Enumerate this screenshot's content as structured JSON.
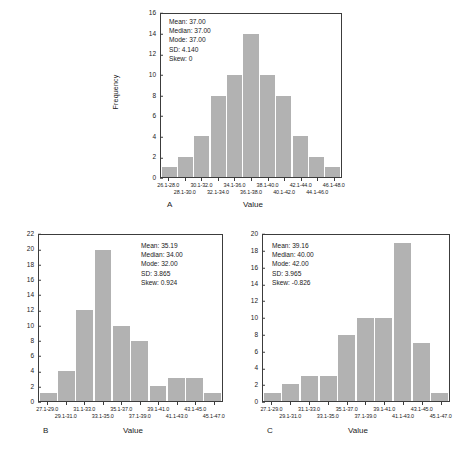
{
  "figure": {
    "background": "#ffffff",
    "bar_color": "#b2b2b2",
    "axis_color": "#3c3c3c"
  },
  "chart_data": [
    {
      "type": "bar",
      "id": "A",
      "panel_letter": "A",
      "title": "",
      "xlabel": "Value",
      "ylabel": "Frequency",
      "ylim": [
        0,
        16
      ],
      "yticks": [
        0,
        2,
        4,
        6,
        8,
        10,
        12,
        14,
        16
      ],
      "grid": false,
      "categories": [
        "26.1-28.0",
        "28.1-30.0",
        "30.1-32.0",
        "32.1-34.0",
        "34.1-36.0",
        "36.1-38.0",
        "38.1-40.0",
        "40.1-42.0",
        "42.1-44.0",
        "44.1-46.0",
        "46.1-48.0"
      ],
      "values": [
        1,
        2,
        4,
        8,
        10,
        14,
        10,
        8,
        4,
        2,
        1
      ],
      "annotations": {
        "mean": "Mean: 37.00",
        "median": "Median: 37.00",
        "mode": "Mode: 37.00",
        "sd": "SD: 4.140",
        "skew": "Skew: 0"
      }
    },
    {
      "type": "bar",
      "id": "B",
      "panel_letter": "B",
      "title": "",
      "xlabel": "Value",
      "ylabel": "",
      "ylim": [
        0,
        22
      ],
      "yticks": [
        0,
        2,
        4,
        6,
        8,
        10,
        12,
        14,
        16,
        18,
        20,
        22
      ],
      "grid": false,
      "categories": [
        "27.1-29.0",
        "29.1-31.0",
        "31.1-33.0",
        "33.1-35.0",
        "35.1-37.0",
        "37.1-39.0",
        "39.1-41.0",
        "41.1-43.0",
        "43.1-45.0",
        "45.1-47.0"
      ],
      "values": [
        1,
        4,
        12,
        20,
        10,
        8,
        2,
        3,
        3,
        1
      ],
      "annotations": {
        "mean": "Mean: 35.19",
        "median": "Median: 34.00",
        "mode": "Mode: 32.00",
        "sd": "SD: 3.865",
        "skew": "Skew: 0.924"
      }
    },
    {
      "type": "bar",
      "id": "C",
      "panel_letter": "C",
      "title": "",
      "xlabel": "Value",
      "ylabel": "",
      "ylim": [
        0,
        20
      ],
      "yticks": [
        0,
        2,
        4,
        6,
        8,
        10,
        12,
        14,
        16,
        18,
        20
      ],
      "grid": false,
      "categories": [
        "27.1-29.0",
        "29.1-31.0",
        "31.1-33.0",
        "33.1-35.0",
        "35.1-37.0",
        "37.1-39.0",
        "39.1-41.0",
        "41.1-43.0",
        "43.1-45.0",
        "45.1-47.0"
      ],
      "values": [
        1,
        2,
        3,
        3,
        8,
        10,
        10,
        19,
        7,
        1
      ],
      "annotations": {
        "mean": "Mean: 39.16",
        "median": "Median: 40.00",
        "mode": "Mode: 42.00",
        "sd": "SD: 3.965",
        "skew": "Skew: -0.826"
      }
    }
  ]
}
